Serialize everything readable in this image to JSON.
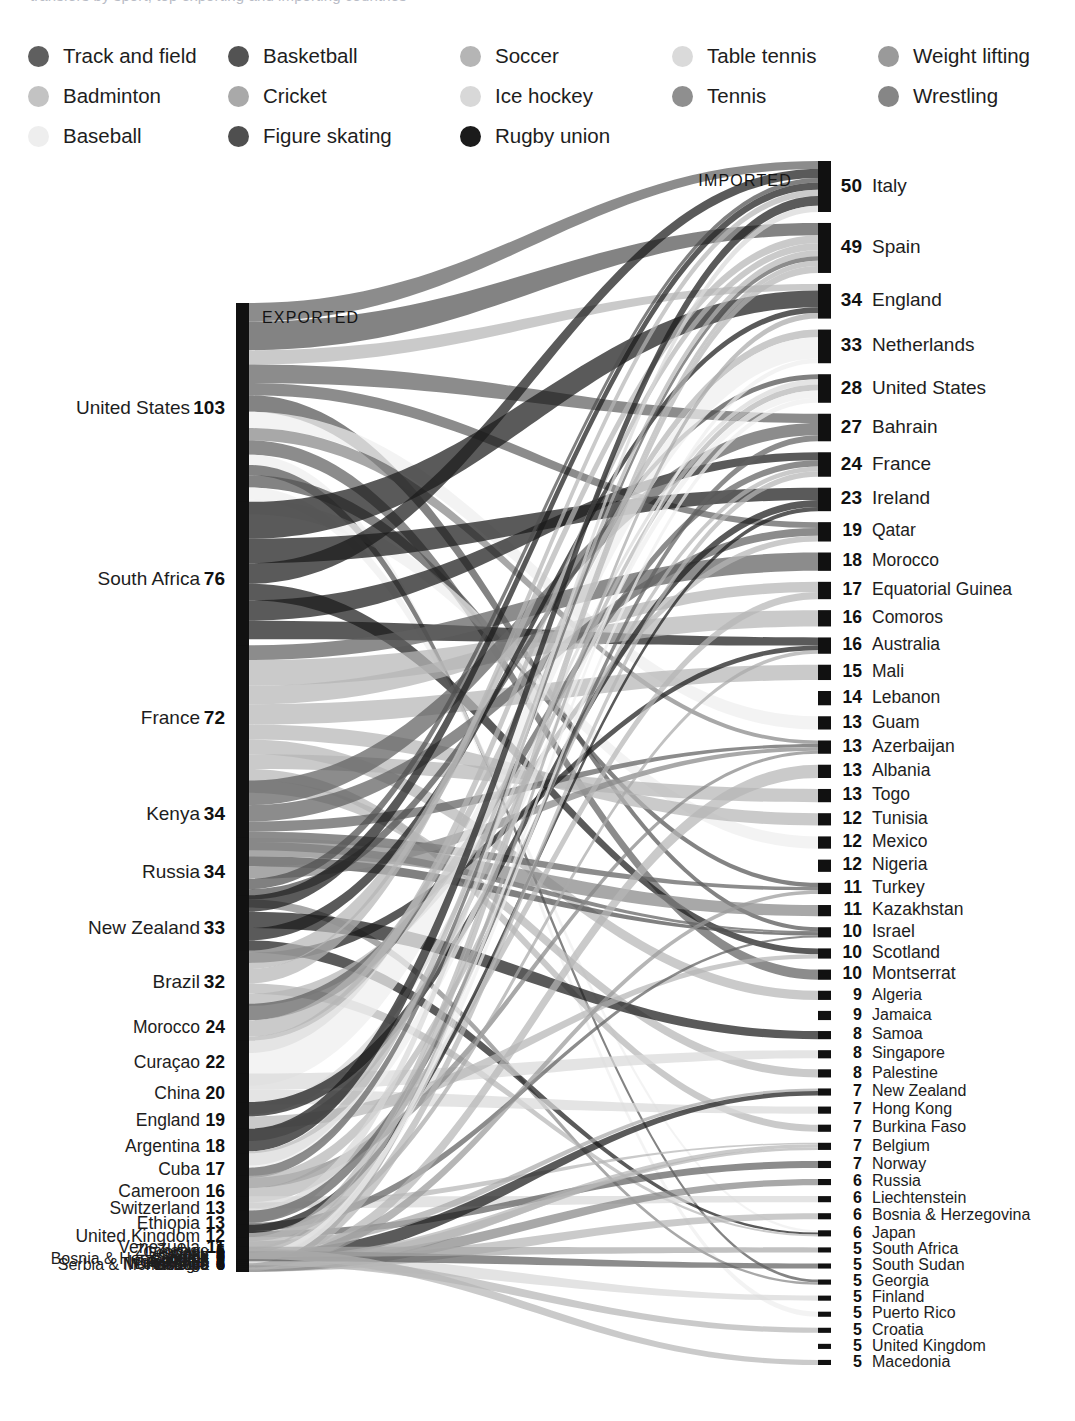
{
  "header": {
    "cropped_caption": "transfers by sport, top exporting and importing countries"
  },
  "legend": {
    "title": "Sport",
    "items": [
      {
        "label": "Track and field",
        "color": "#5f5f5f",
        "col": 0,
        "row": 0
      },
      {
        "label": "Badminton",
        "color": "#c3c3c3",
        "col": 0,
        "row": 1
      },
      {
        "label": "Baseball",
        "color": "#eeeeee",
        "col": 0,
        "row": 2
      },
      {
        "label": "Basketball",
        "color": "#535353",
        "col": 1,
        "row": 0
      },
      {
        "label": "Cricket",
        "color": "#a9a9a9",
        "col": 1,
        "row": 1
      },
      {
        "label": "Figure skating",
        "color": "#4f4f4f",
        "col": 1,
        "row": 2
      },
      {
        "label": "Soccer",
        "color": "#b5b5b5",
        "col": 2,
        "row": 0
      },
      {
        "label": "Ice hockey",
        "color": "#d8d8d8",
        "col": 2,
        "row": 1
      },
      {
        "label": "Rugby union",
        "color": "#1b1b1b",
        "col": 2,
        "row": 2
      },
      {
        "label": "Table tennis",
        "color": "#dadada",
        "col": 3,
        "row": 0
      },
      {
        "label": "Tennis",
        "color": "#8f8f8f",
        "col": 3,
        "row": 1
      },
      {
        "label": "Weight lifting",
        "color": "#9a9a9a",
        "col": 4,
        "row": 0
      },
      {
        "label": "Wrestling",
        "color": "#868686",
        "col": 4,
        "row": 1
      }
    ]
  },
  "bands": {
    "exported_label": "EXPORTED",
    "imported_label": "IMPORTED"
  },
  "chart_data": {
    "type": "sankey",
    "value_unit": "athletes",
    "grid": false,
    "legend_position": "top",
    "left_axis_title": "EXPORTED",
    "right_axis_title": "IMPORTED",
    "sources": [
      {
        "name": "United States",
        "value": 103
      },
      {
        "name": "South Africa",
        "value": 76
      },
      {
        "name": "France",
        "value": 72
      },
      {
        "name": "Kenya",
        "value": 34
      },
      {
        "name": "Russia",
        "value": 34
      },
      {
        "name": "New Zealand",
        "value": 33
      },
      {
        "name": "Brazil",
        "value": 32
      },
      {
        "name": "Morocco",
        "value": 24
      },
      {
        "name": "Curaçao",
        "value": 22
      },
      {
        "name": "China",
        "value": 20
      },
      {
        "name": "England",
        "value": 19
      },
      {
        "name": "Argentina",
        "value": 18
      },
      {
        "name": "Cuba",
        "value": 17
      },
      {
        "name": "Cameroon",
        "value": 16
      },
      {
        "name": "Switzerland",
        "value": 13
      },
      {
        "name": "Ethiopia",
        "value": 13
      },
      {
        "name": "United Kingdom",
        "value": 12
      },
      {
        "name": "Venezuela",
        "value": 11
      },
      {
        "name": "Chile",
        "value": 8
      },
      {
        "name": "Samoa",
        "value": 7
      },
      {
        "name": "Sweden",
        "value": 7
      },
      {
        "name": "Ivory Coast",
        "value": 7
      },
      {
        "name": "DR Congo",
        "value": 7
      },
      {
        "name": "Kosovo",
        "value": 6
      },
      {
        "name": "Serbia & Montenegro",
        "value": 6
      },
      {
        "name": "Ukraine",
        "value": 6
      },
      {
        "name": "Australia",
        "value": 6
      },
      {
        "name": "Netherlands",
        "value": 5
      },
      {
        "name": "Bulgaria",
        "value": 5
      },
      {
        "name": "Bosnia & Herzegovina",
        "value": 5
      },
      {
        "name": "Aruba",
        "value": 5
      },
      {
        "name": "Sudan",
        "value": 5
      },
      {
        "name": "Germany",
        "value": 5
      },
      {
        "name": "Zimbabwe",
        "value": 5
      }
    ],
    "targets": [
      {
        "name": "Italy",
        "value": 50
      },
      {
        "name": "Spain",
        "value": 49
      },
      {
        "name": "England",
        "value": 34
      },
      {
        "name": "Netherlands",
        "value": 33
      },
      {
        "name": "United States",
        "value": 28
      },
      {
        "name": "Bahrain",
        "value": 27
      },
      {
        "name": "France",
        "value": 24
      },
      {
        "name": "Ireland",
        "value": 23
      },
      {
        "name": "Qatar",
        "value": 19
      },
      {
        "name": "Morocco",
        "value": 18
      },
      {
        "name": "Equatorial Guinea",
        "value": 17
      },
      {
        "name": "Comoros",
        "value": 16
      },
      {
        "name": "Australia",
        "value": 16
      },
      {
        "name": "Mali",
        "value": 15
      },
      {
        "name": "Lebanon",
        "value": 14
      },
      {
        "name": "Guam",
        "value": 13
      },
      {
        "name": "Azerbaijan",
        "value": 13
      },
      {
        "name": "Albania",
        "value": 13
      },
      {
        "name": "Togo",
        "value": 13
      },
      {
        "name": "Tunisia",
        "value": 12
      },
      {
        "name": "Mexico",
        "value": 12
      },
      {
        "name": "Nigeria",
        "value": 12
      },
      {
        "name": "Turkey",
        "value": 11
      },
      {
        "name": "Kazakhstan",
        "value": 11
      },
      {
        "name": "Israel",
        "value": 10
      },
      {
        "name": "Scotland",
        "value": 10
      },
      {
        "name": "Montserrat",
        "value": 10
      },
      {
        "name": "Algeria",
        "value": 9
      },
      {
        "name": "Jamaica",
        "value": 9
      },
      {
        "name": "Samoa",
        "value": 8
      },
      {
        "name": "Singapore",
        "value": 8
      },
      {
        "name": "Palestine",
        "value": 8
      },
      {
        "name": "New Zealand",
        "value": 7
      },
      {
        "name": "Hong Kong",
        "value": 7
      },
      {
        "name": "Burkina Faso",
        "value": 7
      },
      {
        "name": "Belgium",
        "value": 7
      },
      {
        "name": "Norway",
        "value": 7
      },
      {
        "name": "Russia",
        "value": 6
      },
      {
        "name": "Liechtenstein",
        "value": 6
      },
      {
        "name": "Bosnia & Herzegovina",
        "value": 6
      },
      {
        "name": "Japan",
        "value": 6
      },
      {
        "name": "South Africa",
        "value": 5
      },
      {
        "name": "South Sudan",
        "value": 5
      },
      {
        "name": "Georgia",
        "value": 5
      },
      {
        "name": "Finland",
        "value": 5
      },
      {
        "name": "Puerto Rico",
        "value": 5
      },
      {
        "name": "Croatia",
        "value": 5
      },
      {
        "name": "United Kingdom",
        "value": 5
      },
      {
        "name": "Macedonia",
        "value": 5
      }
    ],
    "links": [
      {
        "source": "United States",
        "target": "Italy",
        "sport": "Track and field",
        "value": 9
      },
      {
        "source": "United States",
        "target": "Spain",
        "sport": "Basketball",
        "value": 14
      },
      {
        "source": "United States",
        "target": "England",
        "sport": "Soccer",
        "value": 7
      },
      {
        "source": "United States",
        "target": "Bahrain",
        "sport": "Track and field",
        "value": 9
      },
      {
        "source": "United States",
        "target": "Qatar",
        "sport": "Track and field",
        "value": 6
      },
      {
        "source": "United States",
        "target": "Israel",
        "sport": "Basketball",
        "value": 8
      },
      {
        "source": "United States",
        "target": "Guam",
        "sport": "Baseball",
        "value": 8
      },
      {
        "source": "United States",
        "target": "Azerbaijan",
        "sport": "Wrestling",
        "value": 6
      },
      {
        "source": "United States",
        "target": "Montserrat",
        "sport": "Track and field",
        "value": 7
      },
      {
        "source": "United States",
        "target": "Puerto Rico",
        "sport": "Baseball",
        "value": 5
      },
      {
        "source": "United States",
        "target": "Georgia",
        "sport": "Basketball",
        "value": 5
      },
      {
        "source": "United States",
        "target": "Turkey",
        "sport": "Basketball",
        "value": 6
      },
      {
        "source": "United States",
        "target": "Japan",
        "sport": "Baseball",
        "value": 6
      },
      {
        "source": "United States",
        "target": "Mexico",
        "sport": "Baseball",
        "value": 7
      },
      {
        "source": "South Africa",
        "target": "England",
        "sport": "Rugby union",
        "value": 18
      },
      {
        "source": "South Africa",
        "target": "Ireland",
        "sport": "Rugby union",
        "value": 12
      },
      {
        "source": "South Africa",
        "target": "Italy",
        "sport": "Rugby union",
        "value": 10
      },
      {
        "source": "South Africa",
        "target": "Scotland",
        "sport": "Rugby union",
        "value": 8
      },
      {
        "source": "South Africa",
        "target": "France",
        "sport": "Rugby union",
        "value": 10
      },
      {
        "source": "South Africa",
        "target": "Australia",
        "sport": "Rugby union",
        "value": 9
      },
      {
        "source": "South Africa",
        "target": "Namibia",
        "sport": "Rugby union",
        "value": 9
      },
      {
        "source": "France",
        "target": "Morocco",
        "sport": "Track and field",
        "value": 8
      },
      {
        "source": "France",
        "target": "Comoros",
        "sport": "Soccer",
        "value": 14
      },
      {
        "source": "France",
        "target": "Equatorial Guinea",
        "sport": "Soccer",
        "value": 10
      },
      {
        "source": "France",
        "target": "Mali",
        "sport": "Soccer",
        "value": 11
      },
      {
        "source": "France",
        "target": "Tunisia",
        "sport": "Soccer",
        "value": 8
      },
      {
        "source": "France",
        "target": "Algeria",
        "sport": "Soccer",
        "value": 8
      },
      {
        "source": "France",
        "target": "Togo",
        "sport": "Soccer",
        "value": 8
      },
      {
        "source": "France",
        "target": "Burkina Faso",
        "sport": "Soccer",
        "value": 6
      },
      {
        "source": "France",
        "target": "Palestine",
        "sport": "Soccer",
        "value": 7
      },
      {
        "source": "Kenya",
        "target": "Bahrain",
        "sport": "Track and field",
        "value": 12
      },
      {
        "source": "Kenya",
        "target": "Qatar",
        "sport": "Track and field",
        "value": 8
      },
      {
        "source": "Kenya",
        "target": "Azerbaijan",
        "sport": "Track and field",
        "value": 5
      },
      {
        "source": "Kenya",
        "target": "Turkey",
        "sport": "Track and field",
        "value": 5
      },
      {
        "source": "Kenya",
        "target": "Israel",
        "sport": "Track and field",
        "value": 4
      },
      {
        "source": "Russia",
        "target": "Kazakhstan",
        "sport": "Wrestling",
        "value": 9
      },
      {
        "source": "Russia",
        "target": "Israel",
        "sport": "Figure skating",
        "value": 5
      },
      {
        "source": "Russia",
        "target": "Azerbaijan",
        "sport": "Wrestling",
        "value": 6
      },
      {
        "source": "Russia",
        "target": "Italy",
        "sport": "Figure skating",
        "value": 5
      },
      {
        "source": "Russia",
        "target": "United States",
        "sport": "Figure skating",
        "value": 5
      },
      {
        "source": "Russia",
        "target": "Georgia",
        "sport": "Wrestling",
        "value": 4
      },
      {
        "source": "New Zealand",
        "target": "Italy",
        "sport": "Rugby union",
        "value": 8
      },
      {
        "source": "New Zealand",
        "target": "Samoa",
        "sport": "Rugby union",
        "value": 8
      },
      {
        "source": "New Zealand",
        "target": "England",
        "sport": "Rugby union",
        "value": 6
      },
      {
        "source": "New Zealand",
        "target": "Japan",
        "sport": "Rugby union",
        "value": 6
      },
      {
        "source": "New Zealand",
        "target": "Australia",
        "sport": "Rugby union",
        "value": 5
      },
      {
        "source": "Brazil",
        "target": "Spain",
        "sport": "Soccer",
        "value": 9
      },
      {
        "source": "Brazil",
        "target": "Italy",
        "sport": "Soccer",
        "value": 7
      },
      {
        "source": "Brazil",
        "target": "Portugal",
        "sport": "Soccer",
        "value": 5
      },
      {
        "source": "Brazil",
        "target": "Japan",
        "sport": "Soccer",
        "value": 5
      },
      {
        "source": "Brazil",
        "target": "Qatar",
        "sport": "Soccer",
        "value": 6
      },
      {
        "source": "Morocco",
        "target": "France",
        "sport": "Track and field",
        "value": 8
      },
      {
        "source": "Morocco",
        "target": "Netherlands",
        "sport": "Soccer",
        "value": 8
      },
      {
        "source": "Morocco",
        "target": "Spain",
        "sport": "Soccer",
        "value": 8
      },
      {
        "source": "Curaçao",
        "target": "Netherlands",
        "sport": "Baseball",
        "value": 22
      },
      {
        "source": "China",
        "target": "Singapore",
        "sport": "Table tennis",
        "value": 8
      },
      {
        "source": "China",
        "target": "Hong Kong",
        "sport": "Table tennis",
        "value": 7
      },
      {
        "source": "China",
        "target": "United States",
        "sport": "Table tennis",
        "value": 5
      },
      {
        "source": "England",
        "target": "Ireland",
        "sport": "Rugby union",
        "value": 7
      },
      {
        "source": "England",
        "target": "Scotland",
        "sport": "Soccer",
        "value": 6
      },
      {
        "source": "England",
        "target": "United States",
        "sport": "Soccer",
        "value": 6
      },
      {
        "source": "Argentina",
        "target": "Italy",
        "sport": "Rugby union",
        "value": 11
      },
      {
        "source": "Argentina",
        "target": "Spain",
        "sport": "Soccer",
        "value": 7
      },
      {
        "source": "Cuba",
        "target": "United States",
        "sport": "Baseball",
        "value": 7
      },
      {
        "source": "Cuba",
        "target": "Spain",
        "sport": "Track and field",
        "value": 5
      },
      {
        "source": "Cuba",
        "target": "Azerbaijan",
        "sport": "Wrestling",
        "value": 5
      },
      {
        "source": "Cameroon",
        "target": "France",
        "sport": "Soccer",
        "value": 6
      },
      {
        "source": "Cameroon",
        "target": "Equatorial Guinea",
        "sport": "Soccer",
        "value": 7
      },
      {
        "source": "Cameroon",
        "target": "Belgium",
        "sport": "Soccer",
        "value": 3
      },
      {
        "source": "Switzerland",
        "target": "Liechtenstein",
        "sport": "Ice hockey",
        "value": 6
      },
      {
        "source": "Switzerland",
        "target": "Italy",
        "sport": "Ice hockey",
        "value": 7
      },
      {
        "source": "Ethiopia",
        "target": "Bahrain",
        "sport": "Track and field",
        "value": 6
      },
      {
        "source": "Ethiopia",
        "target": "Israel",
        "sport": "Track and field",
        "value": 4
      },
      {
        "source": "Ethiopia",
        "target": "Norway",
        "sport": "Track and field",
        "value": 3
      },
      {
        "source": "United Kingdom",
        "target": "Ireland",
        "sport": "Rugby union",
        "value": 4
      },
      {
        "source": "United Kingdom",
        "target": "Australia",
        "sport": "Cricket",
        "value": 4
      },
      {
        "source": "United Kingdom",
        "target": "New Zealand",
        "sport": "Cricket",
        "value": 4
      },
      {
        "source": "Venezuela",
        "target": "Spain",
        "sport": "Soccer",
        "value": 6
      },
      {
        "source": "Venezuela",
        "target": "United States",
        "sport": "Baseball",
        "value": 5
      },
      {
        "source": "Chile",
        "target": "Spain",
        "sport": "Soccer",
        "value": 8
      },
      {
        "source": "Samoa",
        "target": "New Zealand",
        "sport": "Rugby union",
        "value": 7
      },
      {
        "source": "Sweden",
        "target": "Finland",
        "sport": "Ice hockey",
        "value": 7
      },
      {
        "source": "Ivory Coast",
        "target": "France",
        "sport": "Soccer",
        "value": 7
      },
      {
        "source": "DR Congo",
        "target": "Belgium",
        "sport": "Soccer",
        "value": 7
      },
      {
        "source": "Kosovo",
        "target": "Albania",
        "sport": "Soccer",
        "value": 6
      },
      {
        "source": "Serbia & Montenegro",
        "target": "Bosnia & Herzegovina",
        "sport": "Soccer",
        "value": 6
      },
      {
        "source": "Ukraine",
        "target": "Russia",
        "sport": "Wrestling",
        "value": 6
      },
      {
        "source": "Australia",
        "target": "England",
        "sport": "Cricket",
        "value": 6
      },
      {
        "source": "Netherlands",
        "target": "Belgium",
        "sport": "Soccer",
        "value": 5
      },
      {
        "source": "Bulgaria",
        "target": "Turkey",
        "sport": "Weight lifting",
        "value": 5
      },
      {
        "source": "Bosnia & Herzegovina",
        "target": "Croatia",
        "sport": "Soccer",
        "value": 5
      },
      {
        "source": "Aruba",
        "target": "Netherlands",
        "sport": "Baseball",
        "value": 5
      },
      {
        "source": "Sudan",
        "target": "South Sudan",
        "sport": "Track and field",
        "value": 5
      },
      {
        "source": "Germany",
        "target": "Macedonia",
        "sport": "Soccer",
        "value": 5
      },
      {
        "source": "Zimbabwe",
        "target": "South Africa",
        "sport": "Cricket",
        "value": 5
      }
    ]
  }
}
